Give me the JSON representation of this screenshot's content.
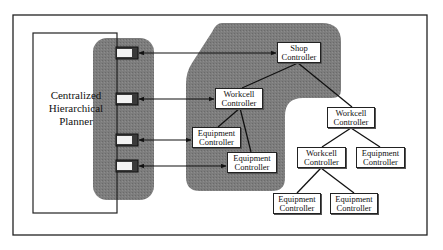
{
  "planner": {
    "label_lines": [
      "Centralized",
      "Hierarchical",
      "Planner"
    ]
  },
  "nodes": [
    {
      "id": "shop",
      "lines": [
        "Shop",
        "Controller"
      ]
    },
    {
      "id": "workcell-1",
      "lines": [
        "Workcell",
        "Controller"
      ]
    },
    {
      "id": "equipment-1",
      "lines": [
        "Equipment",
        "Controller"
      ]
    },
    {
      "id": "equipment-2",
      "lines": [
        "Equipment",
        "Controller"
      ]
    },
    {
      "id": "workcell-2",
      "lines": [
        "Workcell",
        "Controller"
      ]
    },
    {
      "id": "workcell-3",
      "lines": [
        "Workcell",
        "Controller"
      ]
    },
    {
      "id": "equipment-3",
      "lines": [
        "Equipment",
        "Controller"
      ]
    },
    {
      "id": "equipment-4",
      "lines": [
        "Equipment",
        "Controller"
      ]
    },
    {
      "id": "equipment-5",
      "lines": [
        "Equipment",
        "Controller"
      ]
    }
  ],
  "edges": [
    {
      "from": "shop",
      "to": "workcell-1",
      "type": "hierarchy"
    },
    {
      "from": "shop",
      "to": "workcell-2",
      "type": "hierarchy"
    },
    {
      "from": "workcell-1",
      "to": "equipment-1",
      "type": "hierarchy"
    },
    {
      "from": "workcell-1",
      "to": "equipment-2",
      "type": "hierarchy"
    },
    {
      "from": "workcell-2",
      "to": "workcell-3",
      "type": "hierarchy"
    },
    {
      "from": "workcell-2",
      "to": "equipment-3",
      "type": "hierarchy"
    },
    {
      "from": "workcell-3",
      "to": "equipment-4",
      "type": "hierarchy"
    },
    {
      "from": "workcell-3",
      "to": "equipment-5",
      "type": "hierarchy"
    },
    {
      "from": "planner-port-1",
      "to": "shop",
      "type": "bidirectional"
    },
    {
      "from": "planner-port-2",
      "to": "workcell-1",
      "type": "bidirectional"
    },
    {
      "from": "planner-port-3",
      "to": "equipment-1",
      "type": "bidirectional"
    },
    {
      "from": "planner-port-4",
      "to": "equipment-2",
      "type": "bidirectional"
    }
  ],
  "colors": {
    "shade": "#7a7a7a",
    "line": "#1a1a1a",
    "box_fill": "#ffffff",
    "port_fill": "#f2f2f2"
  }
}
